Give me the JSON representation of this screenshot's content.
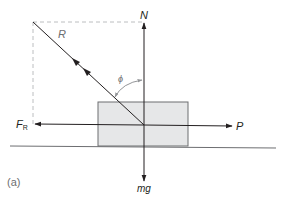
{
  "diagram": {
    "type": "free-body-diagram",
    "panel_label": "(a)",
    "colors": {
      "line": "#231f20",
      "block_fill": "#e6e7e8",
      "block_stroke": "#6d6e71",
      "dashed": "#bcbec0",
      "arc": "#939598",
      "label_gray": "#6d6e71"
    },
    "forces": [
      {
        "id": "N",
        "label": "N",
        "direction": "up",
        "description": "normal reaction"
      },
      {
        "id": "mg",
        "label": "mg",
        "direction": "down",
        "description": "weight"
      },
      {
        "id": "P",
        "label": "P",
        "direction": "right",
        "description": "applied force"
      },
      {
        "id": "FR",
        "label": "F",
        "subscript": "R",
        "direction": "left",
        "description": "friction force"
      },
      {
        "id": "R",
        "label": "R",
        "direction": "up-left",
        "description": "resultant reaction"
      }
    ],
    "angle": {
      "label": "ϕ",
      "between": [
        "R",
        "N"
      ]
    },
    "objects": [
      {
        "id": "block",
        "shape": "rectangle",
        "description": "block on horizontal surface"
      },
      {
        "id": "ground",
        "shape": "line",
        "description": "horizontal surface"
      }
    ]
  }
}
